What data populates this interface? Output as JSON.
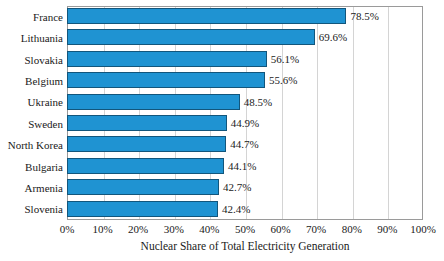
{
  "chart_data": {
    "type": "bar",
    "orientation": "horizontal",
    "title": "",
    "xlabel": "Nuclear Share of Total Electricity Generation",
    "ylabel": "",
    "xlim": [
      0,
      100
    ],
    "xticks": [
      "0%",
      "10%",
      "20%",
      "30%",
      "40%",
      "50%",
      "60%",
      "70%",
      "80%",
      "90%",
      "100%"
    ],
    "xtick_values": [
      0,
      10,
      20,
      30,
      40,
      50,
      60,
      70,
      80,
      90,
      100
    ],
    "grid": true,
    "grid_axis": "x",
    "legend": false,
    "categories": [
      "France",
      "Lithuania",
      "Slovakia",
      "Belgium",
      "Ukraine",
      "Sweden",
      "North Korea",
      "Bulgaria",
      "Armenia",
      "Slovenia"
    ],
    "values": [
      78.5,
      69.6,
      56.1,
      55.6,
      48.5,
      44.9,
      44.7,
      44.1,
      42.7,
      42.4
    ],
    "data_labels": [
      "78.5%",
      "69.6%",
      "56.1%",
      "55.6%",
      "48.5%",
      "44.9%",
      "44.7%",
      "44.1%",
      "42.7%",
      "42.4%"
    ],
    "bar_color": "#1f93d2",
    "bar_border_color": "#12567c",
    "gridline_color": "#d4d4d4",
    "frame_color": "#9a9a9a",
    "background_color": "#ffffff"
  }
}
